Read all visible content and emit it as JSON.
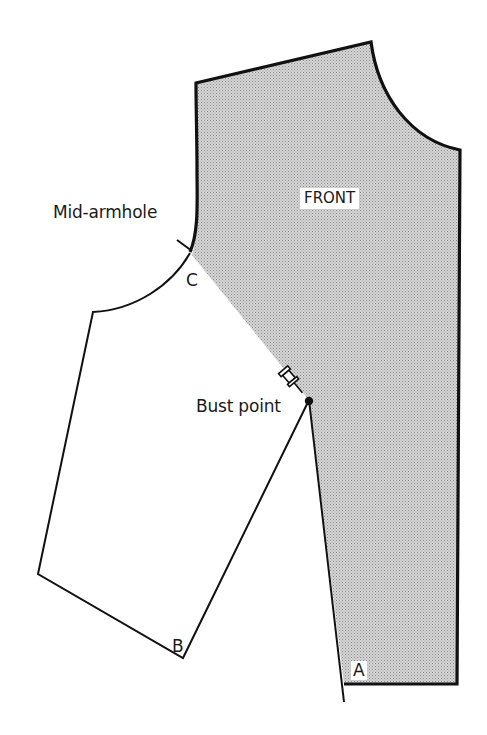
{
  "diagram": {
    "labels": {
      "piece": "FRONT",
      "mid_armhole": "Mid-armhole",
      "bust_point": "Bust point",
      "point_a": "A",
      "point_b": "B",
      "point_c": "C"
    },
    "colors": {
      "outline": "#111111",
      "shade": "#c8c8c8",
      "background": "#ffffff"
    },
    "markers": {
      "pin": "pushpin-icon",
      "bust_dot": "bust-point-dot"
    }
  }
}
